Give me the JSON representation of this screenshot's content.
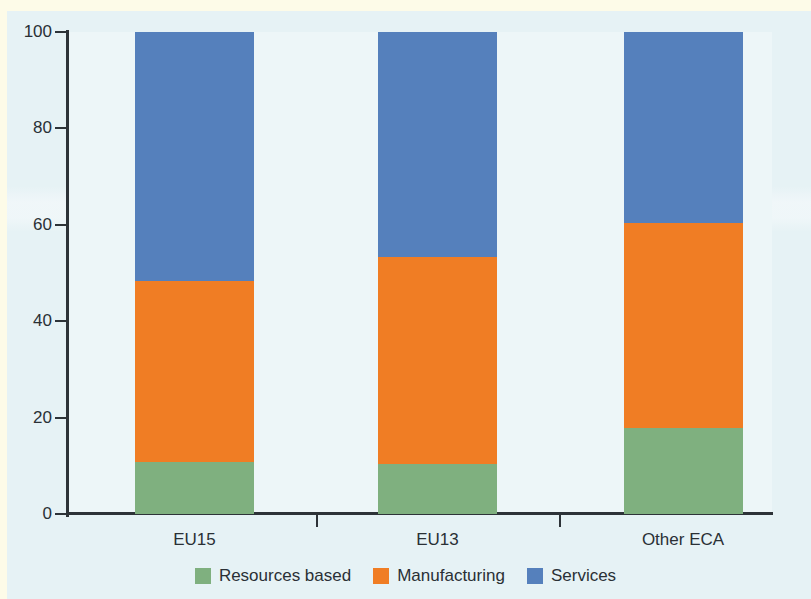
{
  "chart_data": {
    "type": "bar",
    "stacked": true,
    "title": "",
    "subtitle": "",
    "xlabel": "",
    "ylabel": "",
    "categories": [
      "EU15",
      "EU13",
      "Other ECA"
    ],
    "series": [
      {
        "name": "Resources based",
        "color": "#7fb07f",
        "values": [
          10.8,
          10.4,
          17.8
        ]
      },
      {
        "name": "Manufacturing",
        "color": "#f07d24",
        "values": [
          37.5,
          43.0,
          42.6
        ]
      },
      {
        "name": "Services",
        "color": "#5580bc",
        "values": [
          51.7,
          46.6,
          39.6
        ]
      }
    ],
    "cumulative_tops": [
      {
        "category": "EU15",
        "resources_based": 10.8,
        "manufacturing": 48.3,
        "services": 100
      },
      {
        "category": "EU13",
        "resources_based": 10.4,
        "manufacturing": 53.4,
        "services": 100
      },
      {
        "category": "Other ECA",
        "resources_based": 17.8,
        "manufacturing": 60.4,
        "services": 100
      }
    ],
    "ylim": [
      0,
      100
    ],
    "yticks": [
      0,
      20,
      40,
      60,
      80,
      100
    ],
    "ytick_labels": [
      "0",
      "20",
      "40",
      "60",
      "80",
      "100"
    ],
    "grid": false,
    "legend_position": "bottom-center",
    "legend": [
      "Resources based",
      "Manufacturing",
      "Services"
    ],
    "colors": {
      "resources_based": "#7fb07f",
      "manufacturing": "#f07d24",
      "services": "#5580bc",
      "plot_background": "#edf6f8",
      "page_background": "#e6f2f5",
      "axis": "#2d3338",
      "text": "#2a3035"
    }
  },
  "axis": {
    "y_labels": [
      "100",
      "80",
      "60",
      "40",
      "20",
      "0"
    ],
    "x_labels": [
      "EU15",
      "EU13",
      "Other ECA"
    ]
  },
  "legend": {
    "items": [
      {
        "label": "Resources based",
        "color": "#7fb07f"
      },
      {
        "label": "Manufacturing",
        "color": "#f07d24"
      },
      {
        "label": "Services",
        "color": "#5580bc"
      }
    ]
  }
}
